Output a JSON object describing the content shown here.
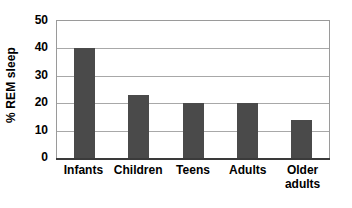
{
  "chart_data": {
    "type": "bar",
    "title": "",
    "subtitle": "",
    "xlabel": "",
    "ylabel": "% REM sleep",
    "categories": [
      "Infants",
      "Children",
      "Teens",
      "Adults",
      "Older\nadults"
    ],
    "values": [
      40,
      23,
      20,
      20,
      14
    ],
    "ylim": [
      0,
      50
    ],
    "yticks": [
      0,
      10,
      20,
      30,
      40,
      50
    ],
    "ytick_labels": [
      "0",
      "10",
      "20",
      "30",
      "40",
      "50"
    ],
    "grid": "horizontal",
    "legend": "none",
    "series": [
      {
        "name": "% REM sleep",
        "values": [
          40,
          23,
          20,
          20,
          14
        ]
      }
    ],
    "colors": {
      "bar": "#4a4a4a",
      "gridline": "#a8a8a8",
      "plot_border": "#9a9a9a",
      "axis": "#3a3a3a",
      "background": "#ffffff",
      "text": "#000000"
    }
  }
}
